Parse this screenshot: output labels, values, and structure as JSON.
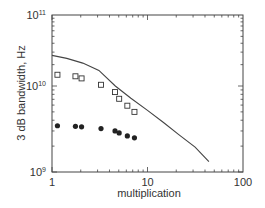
{
  "chart_data": {
    "type": "scatter",
    "title": "",
    "xlabel": "multiplication",
    "ylabel": "3 dB bandwidth, Hz",
    "xscale": "log",
    "yscale": "log",
    "xlim": [
      1,
      100
    ],
    "ylim": [
      1000000000.0,
      100000000000.0
    ],
    "x_ticks": [
      {
        "value": 1,
        "label": "1"
      },
      {
        "value": 10,
        "label": "10"
      },
      {
        "value": 100,
        "label": "100"
      }
    ],
    "y_ticks": [
      {
        "value": 1000000000.0,
        "base": "10",
        "exp": "9"
      },
      {
        "value": 10000000000.0,
        "base": "10",
        "exp": "10"
      },
      {
        "value": 100000000000.0,
        "base": "10",
        "exp": "11"
      }
    ],
    "grid": false,
    "legend": null,
    "series": [
      {
        "name": "open squares",
        "marker": "square-open",
        "x": [
          1.14,
          1.76,
          2.04,
          3.26,
          4.57,
          5.05,
          6.15,
          7.3
        ],
        "y": [
          14400000000.0,
          13700000000.0,
          12800000000.0,
          10400000000.0,
          8500000000.0,
          7100000000.0,
          5900000000.0,
          5000000000.0
        ]
      },
      {
        "name": "filled circles",
        "marker": "circle-filled",
        "x": [
          1.14,
          1.76,
          2.04,
          3.26,
          4.57,
          5.05,
          6.15,
          7.3
        ],
        "y": [
          3450000000.0,
          3400000000.0,
          3350000000.0,
          3200000000.0,
          3000000000.0,
          2850000000.0,
          2630000000.0,
          2500000000.0
        ]
      },
      {
        "name": "theoretical curve",
        "marker": "line",
        "x": [
          1,
          1.43,
          2.1,
          3.1,
          4.6,
          6.7,
          10,
          14.7,
          21.4,
          31.5,
          44
        ],
        "y": [
          27000000000.0,
          24500000000.0,
          21000000000.0,
          16600000000.0,
          10000000000.0,
          7200000000.0,
          5200000000.0,
          3760000000.0,
          2700000000.0,
          1950000000.0,
          1320000000.0
        ]
      }
    ]
  }
}
